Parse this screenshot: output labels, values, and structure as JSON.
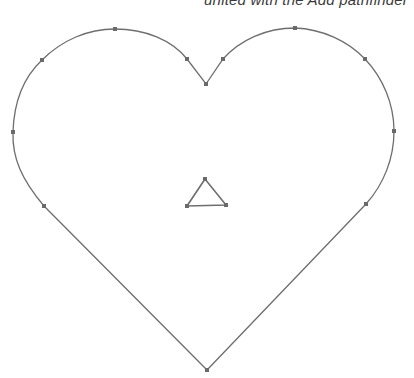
{
  "caption": "united with the Add pathfinder",
  "colors": {
    "stroke": "#6e6e6e",
    "anchor": "#6a6a6a",
    "background": "#ffffff"
  },
  "heart": {
    "anchors": [
      [
        207,
        370
      ],
      [
        44,
        206
      ],
      [
        13,
        132
      ],
      [
        42,
        60
      ],
      [
        115,
        29
      ],
      [
        187,
        59
      ],
      [
        206,
        84
      ],
      [
        223,
        59
      ],
      [
        295,
        28
      ],
      [
        365,
        59
      ],
      [
        394,
        131
      ],
      [
        366,
        204
      ]
    ]
  },
  "triangle": {
    "anchors": [
      [
        205,
        179
      ],
      [
        187,
        206
      ],
      [
        226,
        205
      ]
    ]
  }
}
